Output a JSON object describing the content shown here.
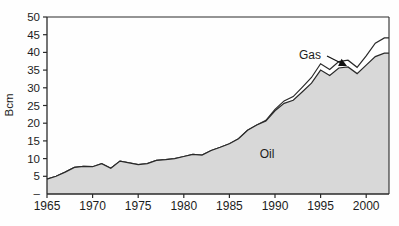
{
  "chart_data": {
    "type": "area",
    "stacked": true,
    "title": "",
    "xlabel": "",
    "ylabel": "Bcm",
    "ylim": [
      0,
      50
    ],
    "grid": false,
    "legend_position": "none",
    "x": [
      1965,
      1966,
      1967,
      1968,
      1969,
      1970,
      1971,
      1972,
      1973,
      1974,
      1975,
      1976,
      1977,
      1978,
      1979,
      1980,
      1981,
      1982,
      1983,
      1984,
      1985,
      1986,
      1987,
      1988,
      1989,
      1990,
      1991,
      1992,
      1993,
      1994,
      1995,
      1996,
      1997,
      1998,
      1999,
      2000,
      2001,
      2002
    ],
    "series": [
      {
        "name": "Oil",
        "values": [
          4.2,
          5.0,
          6.2,
          7.5,
          7.8,
          7.7,
          8.6,
          7.3,
          9.3,
          8.8,
          8.3,
          8.6,
          9.5,
          9.7,
          10.0,
          10.6,
          11.2,
          11.0,
          12.3,
          13.2,
          14.2,
          15.6,
          18.0,
          19.5,
          20.6,
          23.5,
          25.6,
          26.5,
          28.9,
          31.3,
          35.0,
          33.5,
          35.6,
          35.9,
          34.0,
          36.4,
          38.8,
          39.8
        ],
        "fill": "#d8d8d8",
        "stroke": "#2a2a2a"
      },
      {
        "name": "Gas",
        "values": [
          0,
          0,
          0,
          0,
          0,
          0,
          0,
          0,
          0,
          0,
          0,
          0,
          0,
          0,
          0,
          0,
          0,
          0,
          0,
          0,
          0,
          0,
          0,
          0,
          0.2,
          0.4,
          0.7,
          1.0,
          1.3,
          1.6,
          1.8,
          1.7,
          1.8,
          1.9,
          1.8,
          2.6,
          3.8,
          4.3
        ],
        "fill": "#ffffff",
        "stroke": "#2a2a2a"
      }
    ],
    "yticks": [
      {
        "value": 50,
        "label": "50"
      },
      {
        "value": 45,
        "label": "45"
      },
      {
        "value": 40,
        "label": "40"
      },
      {
        "value": 35,
        "label": "35"
      },
      {
        "value": 30,
        "label": "30"
      },
      {
        "value": 25,
        "label": "25"
      },
      {
        "value": 20,
        "label": "20"
      },
      {
        "value": 15,
        "label": "15"
      },
      {
        "value": 10,
        "label": "10"
      },
      {
        "value": 5,
        "label": "5"
      },
      {
        "value": 0,
        "label": "–"
      }
    ],
    "xticks": [
      {
        "value": 1965,
        "label": "1965"
      },
      {
        "value": 1970,
        "label": "1970"
      },
      {
        "value": 1975,
        "label": "1975"
      },
      {
        "value": 1980,
        "label": "1980"
      },
      {
        "value": 1985,
        "label": "1985"
      },
      {
        "value": 1990,
        "label": "1990"
      },
      {
        "value": 1995,
        "label": "1995"
      },
      {
        "value": 2000,
        "label": "2000"
      }
    ],
    "annotations": {
      "oil_label": {
        "text": "Oil",
        "x": 267,
        "y": 158
      },
      "gas_label": {
        "text": "Gas",
        "x": 310,
        "y": 59
      },
      "gas_arrow": {
        "x1": 327,
        "y1": 56,
        "x2": 347,
        "y2": 66
      }
    },
    "layout": {
      "plot": {
        "left": 47,
        "top": 17,
        "right": 389,
        "bottom": 194
      },
      "x_domain": [
        1965,
        2002.5
      ],
      "tick_len": 4,
      "border": "left-bottom-top-right"
    },
    "colors": {
      "axis": "#2a2a2a",
      "text": "#1c1c1c",
      "arrow": "#111111"
    }
  }
}
